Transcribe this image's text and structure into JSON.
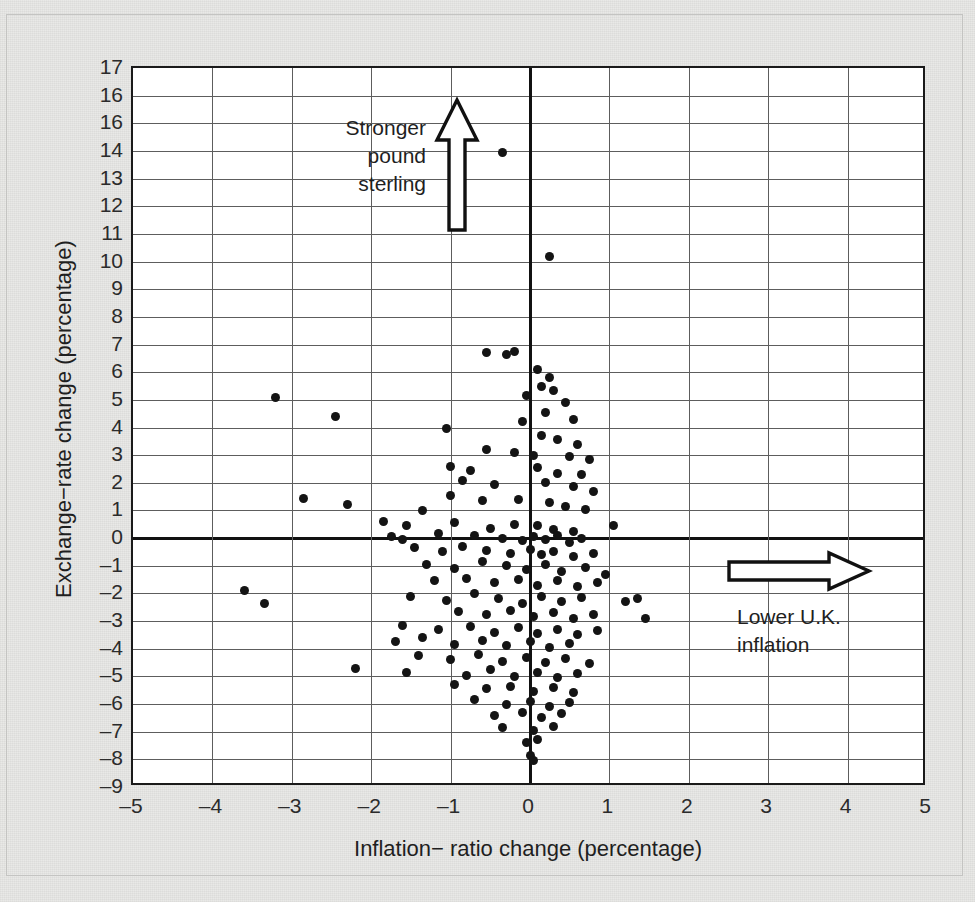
{
  "chart_data": {
    "type": "scatter",
    "title": "",
    "xlabel": "Inflation− ratio change (percentage)",
    "ylabel": "Exchange−rate change (percentage)",
    "xlim": [
      -5,
      5
    ],
    "ylim": [
      -9,
      17
    ],
    "grid": true,
    "legend": null,
    "xticks": [
      "–5",
      "–4",
      "–3",
      "–2",
      "–1",
      "0",
      "1",
      "2",
      "3",
      "4",
      "5"
    ],
    "xtick_values": [
      -5,
      -4,
      -3,
      -2,
      -1,
      0,
      1,
      2,
      3,
      4,
      5
    ],
    "yticks": [
      "17",
      "16",
      "16",
      "14",
      "13",
      "12",
      "11",
      "10",
      "9",
      "8",
      "7",
      "6",
      "5",
      "4",
      "3",
      "2",
      "1",
      "0",
      "–1",
      "–2",
      "–3",
      "–4",
      "–5",
      "–6",
      "–7",
      "–8",
      "–9"
    ],
    "ytick_values": [
      17,
      16,
      15,
      14,
      13,
      12,
      11,
      10,
      9,
      8,
      7,
      6,
      5,
      4,
      3,
      2,
      1,
      0,
      -1,
      -2,
      -3,
      -4,
      -5,
      -6,
      -7,
      -8,
      -9
    ],
    "annotations": [
      {
        "id": "stronger-pound-sterling",
        "text_lines": [
          "Stronger",
          "pound",
          "sterling"
        ],
        "arrow": "up",
        "arrow_style": "hollow-outline"
      },
      {
        "id": "lower-uk-inflation",
        "text_lines": [
          "Lower U.K.",
          "inflation"
        ],
        "arrow": "right",
        "arrow_style": "hollow-outline"
      }
    ],
    "points": [
      [
        -0.35,
        13.95
      ],
      [
        0.25,
        10.2
      ],
      [
        -0.55,
        6.7
      ],
      [
        -0.2,
        6.75
      ],
      [
        -0.3,
        6.65
      ],
      [
        0.1,
        6.1
      ],
      [
        0.25,
        5.8
      ],
      [
        0.15,
        5.5
      ],
      [
        -3.2,
        5.1
      ],
      [
        0.3,
        5.35
      ],
      [
        -0.05,
        5.15
      ],
      [
        0.45,
        4.9
      ],
      [
        -2.45,
        4.4
      ],
      [
        0.2,
        4.55
      ],
      [
        0.55,
        4.3
      ],
      [
        -0.1,
        4.2
      ],
      [
        -1.05,
        3.95
      ],
      [
        0.15,
        3.7
      ],
      [
        0.35,
        3.55
      ],
      [
        0.6,
        3.4
      ],
      [
        -0.55,
        3.2
      ],
      [
        -0.2,
        3.1
      ],
      [
        0.05,
        3.0
      ],
      [
        0.5,
        2.95
      ],
      [
        0.75,
        2.85
      ],
      [
        -1.0,
        2.6
      ],
      [
        -0.75,
        2.45
      ],
      [
        0.1,
        2.55
      ],
      [
        0.35,
        2.35
      ],
      [
        0.65,
        2.3
      ],
      [
        -0.85,
        2.1
      ],
      [
        -0.45,
        1.95
      ],
      [
        0.2,
        2.0
      ],
      [
        0.55,
        1.85
      ],
      [
        0.8,
        1.7
      ],
      [
        -2.85,
        1.45
      ],
      [
        -1.0,
        1.55
      ],
      [
        -0.6,
        1.35
      ],
      [
        -0.15,
        1.4
      ],
      [
        0.25,
        1.3
      ],
      [
        0.45,
        1.15
      ],
      [
        0.7,
        1.05
      ],
      [
        -2.3,
        1.2
      ],
      [
        -1.35,
        1.0
      ],
      [
        -1.85,
        0.6
      ],
      [
        -1.55,
        0.45
      ],
      [
        -0.95,
        0.55
      ],
      [
        -0.5,
        0.35
      ],
      [
        -0.2,
        0.5
      ],
      [
        0.1,
        0.45
      ],
      [
        0.3,
        0.3
      ],
      [
        0.55,
        0.25
      ],
      [
        1.05,
        0.45
      ],
      [
        -1.15,
        0.15
      ],
      [
        -1.75,
        0.05
      ],
      [
        -1.6,
        -0.05
      ],
      [
        -0.7,
        0.1
      ],
      [
        -0.35,
        0.0
      ],
      [
        -0.1,
        -0.1
      ],
      [
        0.05,
        0.05
      ],
      [
        0.2,
        -0.05
      ],
      [
        0.35,
        0.1
      ],
      [
        0.5,
        -0.15
      ],
      [
        0.65,
        0.0
      ],
      [
        -1.45,
        -0.35
      ],
      [
        -1.1,
        -0.5
      ],
      [
        -0.85,
        -0.3
      ],
      [
        -0.55,
        -0.45
      ],
      [
        -0.25,
        -0.55
      ],
      [
        0.0,
        -0.4
      ],
      [
        0.15,
        -0.6
      ],
      [
        0.3,
        -0.5
      ],
      [
        0.55,
        -0.65
      ],
      [
        0.8,
        -0.55
      ],
      [
        -1.3,
        -0.95
      ],
      [
        -0.95,
        -1.1
      ],
      [
        -0.6,
        -0.85
      ],
      [
        -0.3,
        -1.0
      ],
      [
        -0.05,
        -1.15
      ],
      [
        0.2,
        -0.95
      ],
      [
        0.4,
        -1.2
      ],
      [
        0.7,
        -1.05
      ],
      [
        0.95,
        -1.3
      ],
      [
        -1.2,
        -1.55
      ],
      [
        -0.8,
        -1.45
      ],
      [
        -0.45,
        -1.6
      ],
      [
        -0.15,
        -1.5
      ],
      [
        0.1,
        -1.7
      ],
      [
        0.35,
        -1.55
      ],
      [
        0.6,
        -1.75
      ],
      [
        0.85,
        -1.6
      ],
      [
        -3.6,
        -1.9
      ],
      [
        -3.35,
        -2.35
      ],
      [
        -1.5,
        -2.1
      ],
      [
        -1.05,
        -2.25
      ],
      [
        -0.7,
        -2.0
      ],
      [
        -0.4,
        -2.2
      ],
      [
        -0.1,
        -2.35
      ],
      [
        0.15,
        -2.1
      ],
      [
        0.4,
        -2.3
      ],
      [
        0.65,
        -2.15
      ],
      [
        1.2,
        -2.3
      ],
      [
        1.35,
        -2.2
      ],
      [
        -0.9,
        -2.65
      ],
      [
        -0.55,
        -2.75
      ],
      [
        -0.25,
        -2.6
      ],
      [
        0.05,
        -2.85
      ],
      [
        0.3,
        -2.7
      ],
      [
        0.55,
        -2.9
      ],
      [
        0.8,
        -2.75
      ],
      [
        1.45,
        -2.9
      ],
      [
        -1.6,
        -3.15
      ],
      [
        -1.15,
        -3.3
      ],
      [
        -0.75,
        -3.2
      ],
      [
        -0.45,
        -3.4
      ],
      [
        -0.15,
        -3.25
      ],
      [
        0.1,
        -3.45
      ],
      [
        0.35,
        -3.3
      ],
      [
        0.6,
        -3.5
      ],
      [
        0.85,
        -3.35
      ],
      [
        -1.7,
        -3.75
      ],
      [
        -1.35,
        -3.6
      ],
      [
        -0.95,
        -3.85
      ],
      [
        -0.6,
        -3.7
      ],
      [
        -0.3,
        -3.9
      ],
      [
        0.0,
        -3.75
      ],
      [
        0.25,
        -3.95
      ],
      [
        0.5,
        -3.8
      ],
      [
        -1.4,
        -4.25
      ],
      [
        -1.0,
        -4.4
      ],
      [
        -0.65,
        -4.2
      ],
      [
        -0.35,
        -4.45
      ],
      [
        -0.05,
        -4.3
      ],
      [
        0.2,
        -4.5
      ],
      [
        0.45,
        -4.35
      ],
      [
        0.75,
        -4.55
      ],
      [
        -2.2,
        -4.7
      ],
      [
        -1.55,
        -4.85
      ],
      [
        -0.8,
        -4.95
      ],
      [
        -0.5,
        -4.75
      ],
      [
        -0.2,
        -5.0
      ],
      [
        0.1,
        -4.85
      ],
      [
        0.35,
        -5.05
      ],
      [
        0.6,
        -4.9
      ],
      [
        -0.95,
        -5.3
      ],
      [
        -0.55,
        -5.45
      ],
      [
        -0.25,
        -5.35
      ],
      [
        0.05,
        -5.55
      ],
      [
        0.3,
        -5.4
      ],
      [
        0.55,
        -5.6
      ],
      [
        -0.7,
        -5.85
      ],
      [
        -0.3,
        -6.0
      ],
      [
        0.0,
        -5.9
      ],
      [
        0.25,
        -6.1
      ],
      [
        0.5,
        -5.95
      ],
      [
        -0.45,
        -6.4
      ],
      [
        -0.1,
        -6.3
      ],
      [
        0.15,
        -6.5
      ],
      [
        0.4,
        -6.35
      ],
      [
        -0.35,
        -6.85
      ],
      [
        0.05,
        -6.95
      ],
      [
        0.3,
        -6.8
      ],
      [
        -0.05,
        -7.4
      ],
      [
        0.1,
        -7.3
      ],
      [
        0.0,
        -7.85
      ],
      [
        0.05,
        -8.05
      ]
    ]
  }
}
